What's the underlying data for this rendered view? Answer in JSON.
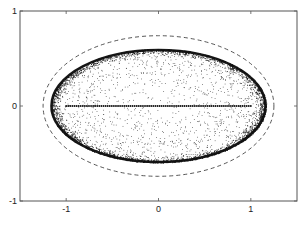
{
  "chart_data": {
    "type": "scatter",
    "title": "",
    "xlabel": "",
    "ylabel": "",
    "xlim": [
      -1.5,
      1.5
    ],
    "ylim": [
      -1,
      1
    ],
    "xticks": [
      -1,
      0,
      1
    ],
    "yticks": [
      -1,
      0,
      1
    ],
    "xtick_labels": [
      "-1",
      "0",
      "1"
    ],
    "ytick_labels": [
      "-1",
      "0",
      "1"
    ],
    "grid": false,
    "legend": null,
    "series": [
      {
        "name": "dense-ellipse-boundary",
        "kind": "scatter-band",
        "shape": "ellipse",
        "center": [
          0,
          0
        ],
        "semi_axes": [
          1.17,
          0.6
        ],
        "band_width": 0.04,
        "point_count": 2600,
        "color": "#111111"
      },
      {
        "name": "interior-scatter",
        "kind": "scatter-fill",
        "shape": "ellipse",
        "center": [
          0,
          0
        ],
        "semi_axes": [
          1.14,
          0.57
        ],
        "point_count": 1300,
        "color": "#222222"
      },
      {
        "name": "segment-points",
        "kind": "points-on-line",
        "from": [
          -1,
          0
        ],
        "to": [
          1,
          0
        ],
        "point_count": 90,
        "color": "#111111"
      },
      {
        "name": "dashed-bounding-ellipse",
        "kind": "curve",
        "shape": "ellipse",
        "center": [
          0,
          0
        ],
        "semi_axes": [
          1.25,
          0.74
        ],
        "line_style": "dashed",
        "color": "#444444"
      }
    ]
  }
}
